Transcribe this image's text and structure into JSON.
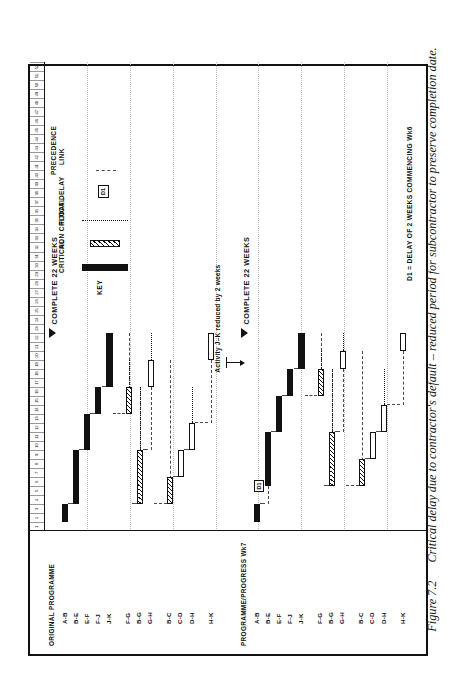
{
  "caption": {
    "figure_number": "Figure 7.2",
    "text": "Critical delay due to contractor's default – reduced period for subcontractor to preserve completion date."
  },
  "chart_data": {
    "type": "bar",
    "title": "",
    "xlabel": "",
    "ylabel": "",
    "xlim": [
      0,
      52
    ],
    "grid": true,
    "week_ticks": [
      "1",
      "2",
      "3",
      "4",
      "5",
      "6",
      "7",
      "8",
      "9",
      "10",
      "11",
      "12",
      "13",
      "14",
      "15",
      "16",
      "17",
      "18",
      "19",
      "20",
      "21",
      "22",
      "23",
      "24",
      "25",
      "26",
      "27",
      "28",
      "29",
      "30",
      "31",
      "32",
      "33",
      "34",
      "35",
      "36",
      "37",
      "38",
      "39",
      "40",
      "41",
      "42",
      "43",
      "44",
      "45",
      "46",
      "47",
      "48",
      "49",
      "50",
      "51",
      "52"
    ],
    "groups": [
      {
        "title": "ORIGINAL PROGRAMME",
        "completion_label": "COMPLETE 22 WEEKS",
        "completion_week": 22,
        "activities": [
          {
            "label": "A-B",
            "type": "critical",
            "start": 1,
            "finish": 3
          },
          {
            "label": "B-E",
            "type": "critical",
            "start": 3,
            "finish": 9
          },
          {
            "label": "E-F",
            "type": "critical",
            "start": 9,
            "finish": 13
          },
          {
            "label": "F-J",
            "type": "critical",
            "start": 13,
            "finish": 16
          },
          {
            "label": "J-K",
            "type": "critical",
            "start": 16,
            "finish": 22
          },
          {
            "label": "F-G",
            "type": "noncritical",
            "start": 13,
            "finish": 16,
            "float_to": 19
          },
          {
            "label": "B-G",
            "type": "noncritical",
            "start": 3,
            "finish": 9,
            "float_to": 16
          },
          {
            "label": "G-H",
            "type": "open",
            "start": 16,
            "finish": 19,
            "float_to": 22
          },
          {
            "label": "B-C",
            "type": "noncritical",
            "start": 3,
            "finish": 6
          },
          {
            "label": "C-D",
            "type": "open",
            "start": 6,
            "finish": 9
          },
          {
            "label": "D-H",
            "type": "open",
            "start": 9,
            "finish": 12,
            "float_to": 16
          },
          {
            "label": "H-K",
            "type": "open",
            "start": 19,
            "finish": 22
          }
        ]
      },
      {
        "title": "PROGRAMME/PROGRESS Wk7",
        "completion_label": "COMPLETE 22 WEEKS",
        "completion_week": 22,
        "delay_marker": "D1",
        "delay_week": 5,
        "activities": [
          {
            "label": "A-B",
            "type": "critical",
            "start": 1,
            "finish": 3
          },
          {
            "label": "B-E",
            "type": "critical",
            "start": 5,
            "finish": 11
          },
          {
            "label": "E-F",
            "type": "critical",
            "start": 11,
            "finish": 15
          },
          {
            "label": "F-J",
            "type": "critical",
            "start": 15,
            "finish": 18
          },
          {
            "label": "J-K",
            "type": "critical",
            "start": 18,
            "finish": 22
          },
          {
            "label": "F-G",
            "type": "noncritical",
            "start": 15,
            "finish": 18,
            "float_to": 20
          },
          {
            "label": "B-G",
            "type": "noncritical",
            "start": 5,
            "finish": 11,
            "float_to": 18
          },
          {
            "label": "G-H",
            "type": "open",
            "start": 18,
            "finish": 20,
            "float_to": 22
          },
          {
            "label": "B-C",
            "type": "noncritical",
            "start": 5,
            "finish": 8
          },
          {
            "label": "C-D",
            "type": "open",
            "start": 8,
            "finish": 11
          },
          {
            "label": "D-H",
            "type": "open",
            "start": 11,
            "finish": 14,
            "float_to": 18
          },
          {
            "label": "H-K",
            "type": "open",
            "start": 20,
            "finish": 22
          }
        ]
      }
    ],
    "annotations": [
      {
        "id": "activity-reduced",
        "text": "Activity  J–K  reduced by 2 weeks"
      },
      {
        "id": "delay-note",
        "text": "D1 = DELAY OF 2 WEEKS COMMENCING Wk6"
      }
    ]
  },
  "key": {
    "title": "KEY",
    "items": [
      {
        "name": "critical",
        "label": "CRITICAL",
        "swatch": "solid-black-bar"
      },
      {
        "name": "non-critical",
        "label": "NON CRITICAL",
        "swatch": "hatched-bar"
      },
      {
        "name": "float",
        "label": "FLOAT",
        "swatch": "dotted-line"
      },
      {
        "name": "delay",
        "label": "DELAY",
        "swatch": "boxed-d1",
        "swatch_text": "D1"
      },
      {
        "name": "precedence",
        "label": "PRECEDENCE\nLINK",
        "swatch": "dashed-line"
      }
    ],
    "delay_swatch_text": "D1",
    "precedence_label_line1": "PRECEDENCE",
    "precedence_label_line2": "LINK"
  },
  "colors": {
    "ink": "#111111",
    "grid": "#b9b9b9",
    "link": "#4a4a4a",
    "paper": "#ffffff"
  }
}
